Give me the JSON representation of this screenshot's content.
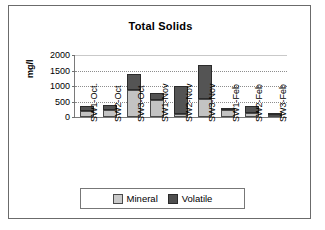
{
  "chart_data": {
    "type": "bar",
    "subtype": "stacked-column",
    "title": "Total Solids",
    "xlabel": "",
    "ylabel": "mg/l",
    "ylim": [
      0,
      2000
    ],
    "yticks": [
      0,
      500,
      1000,
      1500,
      2000
    ],
    "ytick_labels": [
      "0",
      "500",
      "1000",
      "1500",
      "2000"
    ],
    "grid": "horizontal-dotted",
    "legend_position": "bottom",
    "categories": [
      "SW1-Oct.",
      "SW2-Oct",
      "SW3-Oct",
      "SW1-Nov",
      "SW2-Nov",
      "SW3-Nov",
      "SW1-Feb",
      "SW2-Feb",
      "SW3-Feb"
    ],
    "series": [
      {
        "name": "Mineral",
        "color": "#c3c3c3",
        "values": [
          210,
          235,
          880,
          555,
          100,
          570,
          230,
          140,
          50
        ]
      },
      {
        "name": "Volatile",
        "color": "#545454",
        "values": [
          135,
          140,
          500,
          215,
          900,
          1100,
          50,
          215,
          15
        ]
      }
    ],
    "totals": [
      345,
      375,
      1380,
      770,
      1000,
      1670,
      280,
      355,
      65
    ]
  },
  "legend": {
    "items": [
      {
        "label": "Mineral"
      },
      {
        "label": "Volatile"
      }
    ]
  }
}
